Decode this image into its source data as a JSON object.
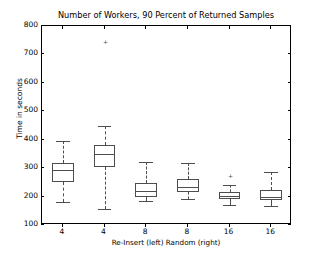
{
  "chart_data": {
    "type": "box",
    "title": "Number of Workers, 90 Percent of Returned Samples",
    "xlabel": "Re-Insert (left)   Random (right)",
    "ylabel": "Time in seconds",
    "ylim": [
      100,
      800
    ],
    "yticks": [
      100,
      200,
      300,
      400,
      500,
      600,
      700,
      800
    ],
    "ytick_labels": [
      "100",
      "200",
      "300",
      "400",
      "500",
      "600",
      "700",
      "800"
    ],
    "xtick_labels": [
      "4",
      "4",
      "8",
      "8",
      "16",
      "16"
    ],
    "grid": false,
    "legend": null,
    "boxes": [
      {
        "label": "4",
        "group": "Re-Insert",
        "whisker_low": 180,
        "q1": 250,
        "median": 292,
        "q3": 318,
        "whisker_high": 395,
        "fliers": []
      },
      {
        "label": "4",
        "group": "Random",
        "whisker_low": 155,
        "q1": 305,
        "median": 348,
        "q3": 383,
        "whisker_high": 448,
        "fliers": [
          745
        ]
      },
      {
        "label": "8",
        "group": "Re-Insert",
        "whisker_low": 185,
        "q1": 200,
        "median": 218,
        "q3": 248,
        "whisker_high": 320,
        "fliers": []
      },
      {
        "label": "8",
        "group": "Random",
        "whisker_low": 190,
        "q1": 215,
        "median": 235,
        "q3": 262,
        "whisker_high": 318,
        "fliers": []
      },
      {
        "label": "16",
        "group": "Re-Insert",
        "whisker_low": 172,
        "q1": 190,
        "median": 202,
        "q3": 215,
        "whisker_high": 240,
        "fliers": [
          275
        ]
      },
      {
        "label": "16",
        "group": "Random",
        "whisker_low": 168,
        "q1": 188,
        "median": 200,
        "q3": 222,
        "whisker_high": 285,
        "fliers": []
      }
    ]
  }
}
